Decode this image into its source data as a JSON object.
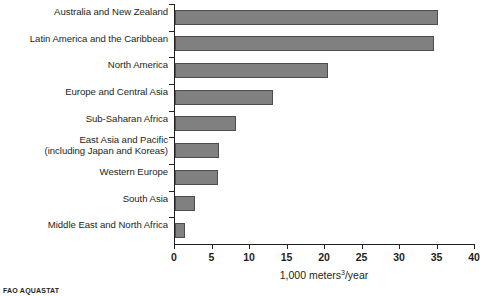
{
  "chart_data": {
    "type": "bar",
    "orientation": "horizontal",
    "title": "",
    "xlabel": "1,000 meters<sup>3</sup>/year",
    "xlabel_text": "1,000 meters3/year",
    "ylabel": "",
    "categories": [
      "Australia and New Zealand",
      "Latin America and the Caribbean",
      "North America",
      "Europe and Central Asia",
      "Sub-Saharan Africa",
      "East Asia and Pacific (including Japan and Koreas)",
      "Western Europe",
      "South Asia",
      "Middle East and North Africa"
    ],
    "values": [
      35.0,
      34.5,
      20.4,
      13.0,
      8.1,
      5.9,
      5.7,
      2.7,
      1.3
    ],
    "xlim": [
      0,
      40
    ],
    "xticks": [
      0,
      5,
      10,
      15,
      20,
      25,
      30,
      35,
      40
    ],
    "grid": false,
    "legend": false,
    "bar_color": "#808080",
    "bar_border_color": "#4d4d4d",
    "axis_color": "#231f20",
    "text_color": "#231f20"
  },
  "axis": {
    "x_title_main": "1,000 meters",
    "x_title_sup": "3",
    "x_title_tail": "/year",
    "tick_labels": [
      "0",
      "5",
      "10",
      "15",
      "20",
      "25",
      "30",
      "35",
      "40"
    ]
  },
  "category_labels": [
    {
      "line1": "Australia and New Zealand",
      "line2": ""
    },
    {
      "line1": "Latin America and the Caribbean",
      "line2": ""
    },
    {
      "line1": "North America",
      "line2": ""
    },
    {
      "line1": "Europe and Central Asia",
      "line2": ""
    },
    {
      "line1": "Sub-Saharan Africa",
      "line2": ""
    },
    {
      "line1": "East Asia and Pacific",
      "line2": "(including Japan and Koreas)"
    },
    {
      "line1": "Western Europe",
      "line2": ""
    },
    {
      "line1": "South Asia",
      "line2": ""
    },
    {
      "line1": "Middle East and North Africa",
      "line2": ""
    }
  ],
  "footer": {
    "source_note": "FAO AQUASTAT"
  }
}
